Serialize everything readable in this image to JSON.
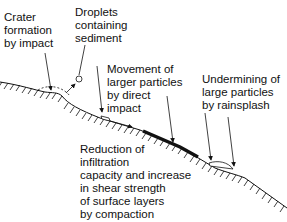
{
  "diagram": {
    "labels": {
      "crater": "Crater\nformation\nby impact",
      "droplets": "Droplets\ncontaining\nsediment",
      "movement": "Movement of\nlarger particles\nby direct\nimpact",
      "undermining": "Undermining of\nlarge particles\nby rainsplash",
      "reduction": "Reduction of\ninfiltration\ncapacity and increase\nin shear strength\nof surface layers\nby compaction"
    }
  }
}
